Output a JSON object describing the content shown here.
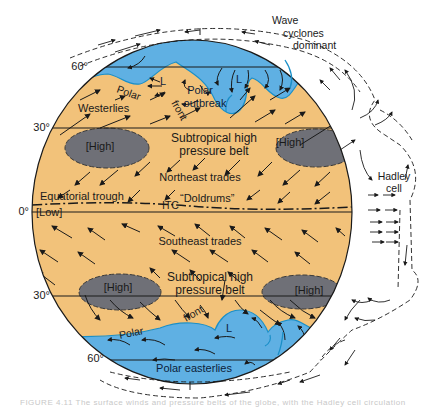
{
  "figure": {
    "colors": {
      "land_band": "#f2c27a",
      "polar_air": "#5fb0e3",
      "high_cell": "#6f7077",
      "outline": "#1a1a1a",
      "front_line": "#1a8fc8",
      "background": "#ffffff"
    },
    "latitudes": {
      "n60": "60°",
      "n30": "30°",
      "eq": "0°",
      "s30": "30°",
      "s60": "60°"
    },
    "labels": {
      "wave_cyclones": [
        "Wave",
        "cyclones",
        "dominant"
      ],
      "polar_outbreak": [
        "Polar",
        "outbreak"
      ],
      "low_n1": "L",
      "low_n2": "L",
      "low_s": "L",
      "polar_front_n_1": "Polar",
      "polar_front_n_2": "front",
      "westerlies": "Westerlies",
      "high_nw": "[High]",
      "high_ne": "[High]",
      "subtropical_n_1": "Subtropical high",
      "subtropical_n_2": "pressure belt",
      "northeast_trades": "Northeast trades",
      "equatorial_trough": "Equatorial trough",
      "itc": "ITC",
      "doldrums": "“Doldrums”",
      "low_eq": "[Low]",
      "hadley_cell": [
        "Hadley",
        "cell"
      ],
      "southeast_trades": "Southeast trades",
      "subtropical_s_1": "Subtropical high",
      "subtropical_s_2": "pressure belt",
      "high_sw": "[High]",
      "high_se": "[High]",
      "polar_front_s_1": "Polar",
      "polar_front_s_2": "front",
      "polar_easterlies": "Polar easterlies"
    },
    "caption": "FIGURE 4.11  The surface winds and pressure belts of the globe, with the Hadley cell circulation"
  }
}
